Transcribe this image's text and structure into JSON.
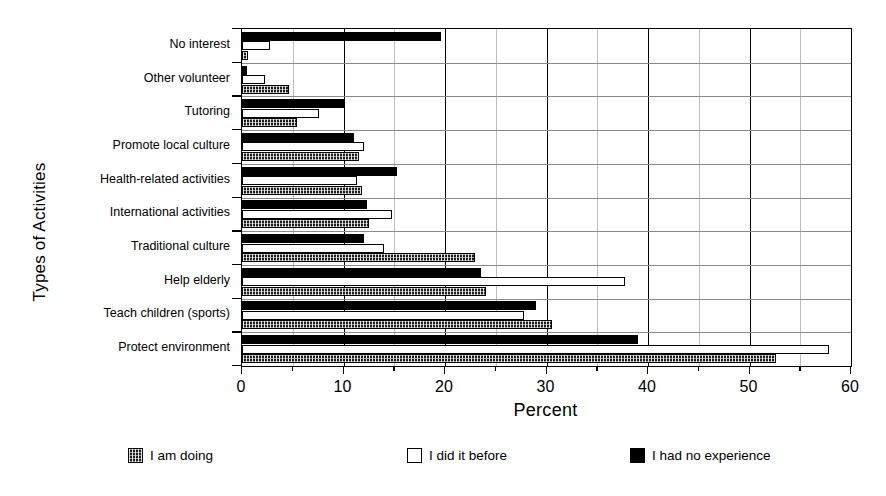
{
  "chart_data": {
    "type": "bar",
    "orientation": "horizontal",
    "title": "",
    "xlabel": "Percent",
    "ylabel": "Types of Activities",
    "xlim": [
      0,
      60
    ],
    "xticks": [
      0,
      10,
      20,
      30,
      40,
      50,
      60
    ],
    "xtick_labels": [
      "0",
      "10",
      "20",
      "30",
      "40",
      "50",
      "60"
    ],
    "minor_xticks": [
      5,
      15,
      25,
      35,
      45,
      55
    ],
    "grid": true,
    "legend_position": "bottom",
    "categories": [
      "No interest",
      "Other volunteer",
      "Tutoring",
      "Promote local culture",
      "Health-related activities",
      "International activities",
      "Traditional culture",
      "Help elderly",
      "Teach children (sports)",
      "Protect environment"
    ],
    "series": [
      {
        "name": "I had no experience",
        "style": "black",
        "color": "#000000",
        "values": [
          19.6,
          0.5,
          10.0,
          11.0,
          15.3,
          12.3,
          12.0,
          23.5,
          29.0,
          39.0
        ]
      },
      {
        "name": "I did it before",
        "style": "white",
        "color": "#ffffff",
        "values": [
          2.8,
          2.3,
          7.6,
          12.0,
          11.3,
          14.8,
          14.0,
          37.7,
          27.8,
          57.8
        ]
      },
      {
        "name": "I am doing",
        "style": "hatch",
        "color": "#1c1c1c",
        "values": [
          0.6,
          4.6,
          5.4,
          11.5,
          11.8,
          12.5,
          23.0,
          24.0,
          30.5,
          52.6
        ]
      }
    ]
  },
  "legend": {
    "items": [
      {
        "label": "I am doing",
        "style": "hatch"
      },
      {
        "label": "I did it before",
        "style": "white"
      },
      {
        "label": "I had no experience",
        "style": "black"
      }
    ]
  }
}
